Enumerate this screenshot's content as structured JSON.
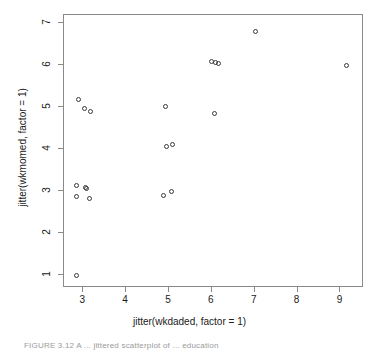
{
  "figure": {
    "caption": "FIGURE 3.12    A ... jittered scatterplot of ... education"
  },
  "chart_data": {
    "type": "scatter",
    "title": "",
    "xlabel": "jitter(wkdaded, factor = 1)",
    "ylabel": "jitter(wkmomed, factor = 1)",
    "xlim": [
      2.55,
      9.55
    ],
    "ylim": [
      0.7,
      7.2
    ],
    "xticks": [
      3,
      4,
      5,
      6,
      7,
      8,
      9
    ],
    "xticklabels": [
      "3",
      "4",
      "5",
      "6",
      "7",
      "8",
      "9"
    ],
    "yticks": [
      1,
      2,
      3,
      4,
      5,
      6,
      7
    ],
    "yticklabels": [
      "1",
      "2",
      "3",
      "4",
      "5",
      "6",
      "7"
    ],
    "grid": false,
    "legend": null,
    "marker": "open-circle",
    "marker_color": "#3a3a3a",
    "frame_color": "#8a8a8a",
    "n_points": 19,
    "x": [
      2.85,
      2.85,
      2.85,
      3.05,
      3.07,
      3.15,
      2.88,
      3.03,
      3.17,
      4.88,
      5.05,
      4.93,
      5.08,
      4.92,
      6.05,
      5.98,
      6.08,
      6.15,
      7.02,
      9.15
    ],
    "y": [
      1.0,
      3.15,
      2.88,
      3.1,
      3.08,
      2.82,
      5.18,
      4.98,
      4.9,
      2.9,
      3.0,
      4.07,
      4.12,
      5.02,
      4.85,
      6.1,
      6.07,
      6.05,
      6.8,
      6.0
    ],
    "points": [
      {
        "x": 2.85,
        "y": 1.0
      },
      {
        "x": 2.85,
        "y": 3.15
      },
      {
        "x": 2.85,
        "y": 2.88
      },
      {
        "x": 3.05,
        "y": 3.1
      },
      {
        "x": 3.07,
        "y": 3.06
      },
      {
        "x": 3.15,
        "y": 2.82
      },
      {
        "x": 2.88,
        "y": 5.18
      },
      {
        "x": 3.03,
        "y": 4.98
      },
      {
        "x": 3.17,
        "y": 4.9
      },
      {
        "x": 4.88,
        "y": 2.9
      },
      {
        "x": 5.05,
        "y": 3.0
      },
      {
        "x": 4.93,
        "y": 4.07
      },
      {
        "x": 5.08,
        "y": 4.12
      },
      {
        "x": 4.92,
        "y": 5.02
      },
      {
        "x": 6.05,
        "y": 4.85
      },
      {
        "x": 5.98,
        "y": 6.1
      },
      {
        "x": 6.08,
        "y": 6.07
      },
      {
        "x": 6.15,
        "y": 6.05
      },
      {
        "x": 7.02,
        "y": 6.8
      },
      {
        "x": 9.15,
        "y": 6.0
      }
    ]
  }
}
